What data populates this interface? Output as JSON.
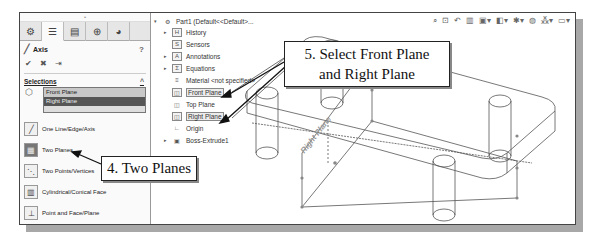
{
  "property_manager": {
    "tabs": [
      {
        "name": "feature-manager",
        "icon": "⚙"
      },
      {
        "name": "property-manager",
        "icon": "☰"
      },
      {
        "name": "configuration-manager",
        "icon": "▤"
      },
      {
        "name": "dimxpert-manager",
        "icon": "⊕"
      },
      {
        "name": "display-manager",
        "icon": "◕"
      }
    ],
    "title": "Axis",
    "help_icon": "?",
    "actions": {
      "ok": "✔",
      "cancel": "✖",
      "pushpin": "⇥"
    },
    "selections_header": "Selections",
    "collapse": "^",
    "selections": [
      "Front Plane",
      "Right Plane"
    ],
    "options": [
      {
        "label": "One Line/Edge/Axis",
        "icon": "╱"
      },
      {
        "label": "Two Planes",
        "icon": "▦",
        "active": true
      },
      {
        "label": "Two Points/Vertices",
        "icon": "⋱"
      },
      {
        "label": "Cylindrical/Conical Face",
        "icon": "▥"
      },
      {
        "label": "Point and Face/Plane",
        "icon": "⊥"
      }
    ]
  },
  "feature_tree": {
    "root": "Part1  (Default<<Default>...",
    "items": [
      {
        "label": "History",
        "icon": "H",
        "expandable": true
      },
      {
        "label": "Sensors",
        "icon": "S",
        "expandable": false
      },
      {
        "label": "Annotations",
        "icon": "A",
        "expandable": true
      },
      {
        "label": "Equations",
        "icon": "Σ",
        "expandable": true
      },
      {
        "label": "Material <not specified>",
        "icon": "≡",
        "expandable": false
      },
      {
        "label": "Front Plane",
        "icon": "◫",
        "expandable": false,
        "selected": true
      },
      {
        "label": "Top Plane",
        "icon": "◫",
        "expandable": false
      },
      {
        "label": "Right Plane",
        "icon": "◫",
        "expandable": false,
        "selected": true
      },
      {
        "label": "Origin",
        "icon": "∟",
        "expandable": false
      },
      {
        "label": "Boss-Extrude1",
        "icon": "▣",
        "expandable": true
      }
    ]
  },
  "viewport": {
    "plane_label": "Right Plane",
    "toolbar_icons": [
      "zoom-to-fit",
      "zoom-area",
      "previous-view",
      "section-view",
      "view-orientation",
      "display-style",
      "hide-show",
      "edit-appearance",
      "apply-scene",
      "view-settings"
    ]
  },
  "callouts": {
    "step5_line1": "5. Select Front Plane",
    "step5_line2": "and Right Plane",
    "step4": "4. Two Planes"
  }
}
